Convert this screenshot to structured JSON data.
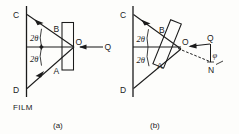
{
  "figure": {
    "type": "diagram",
    "background_color": "#fdfdfb",
    "ink_color": "#1b1b1b",
    "panels": [
      {
        "id": "a",
        "caption": "(a)",
        "labels": {
          "top_film_point": "C",
          "bottom_film_point": "D",
          "upper_crystal_point": "B",
          "lower_crystal_point": "A",
          "center": "O",
          "beam": "Q",
          "film": "FILM",
          "angle_upper": "2θ",
          "angle_lower": "2θ"
        }
      },
      {
        "id": "b",
        "caption": "(b)",
        "labels": {
          "top_film_point": "C",
          "bottom_film_point": "D",
          "upper_crystal_point": "B",
          "lower_crystal_point": "A",
          "center": "O",
          "beam": "Q",
          "normal": "N",
          "angle_upper": "2θ",
          "angle_lower": "2θ",
          "tilt_angle": "φ"
        }
      }
    ]
  }
}
